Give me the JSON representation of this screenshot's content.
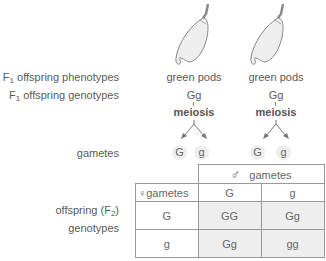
{
  "labels": {
    "phenotypes": "F",
    "phenotypes_sub": "1",
    "phenotypes_rest": " offspring phenotypes",
    "genotypes": "F",
    "genotypes_sub": "1",
    "genotypes_rest": " offspring genotypes",
    "gametes": "gametes",
    "offspring_line1_pre": "offspring (F",
    "offspring_line1_sub": "2",
    "offspring_line1_post": ")",
    "offspring_line2": "genotypes"
  },
  "parents": [
    {
      "phenotype": "green pods",
      "genotype": "Gg",
      "process": "meiosis",
      "gametes": [
        "G",
        "g"
      ]
    },
    {
      "phenotype": "green pods",
      "genotype": "Gg",
      "process": "meiosis",
      "gametes": [
        "G",
        "g"
      ]
    }
  ],
  "punnett": {
    "male_symbol": "♂",
    "male_header": "gametes",
    "female_symbol": "♀",
    "female_header": "gametes",
    "columns": [
      "G",
      "g"
    ],
    "rows": [
      {
        "gamete": "G",
        "cells": [
          "GG",
          "Gg"
        ]
      },
      {
        "gamete": "g",
        "cells": [
          "Gg",
          "gg"
        ]
      }
    ]
  },
  "colors": {
    "pod_fill": "#eeeeee",
    "pod_stroke": "#888888",
    "cell_shade": "#eeeeee",
    "border": "#999999"
  }
}
